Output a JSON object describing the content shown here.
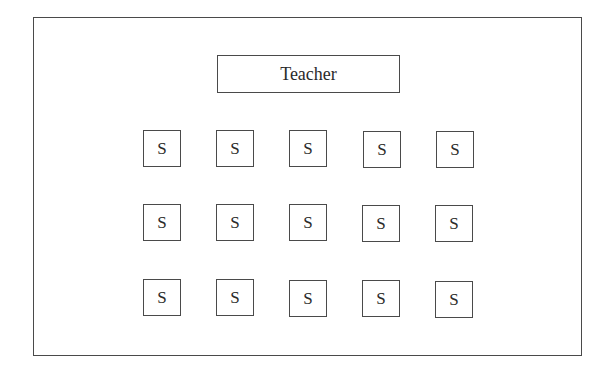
{
  "diagram": {
    "teacher": {
      "label": "Teacher"
    },
    "students": {
      "label": "S",
      "rows": 3,
      "columns": 5,
      "seats": [
        [
          "S",
          "S",
          "S",
          "S",
          "S"
        ],
        [
          "S",
          "S",
          "S",
          "S",
          "S"
        ],
        [
          "S",
          "S",
          "S",
          "S",
          "S"
        ]
      ]
    },
    "colors": {
      "stroke": "#4a4a4a",
      "text": "#2a2a2a",
      "background": "#ffffff"
    }
  }
}
